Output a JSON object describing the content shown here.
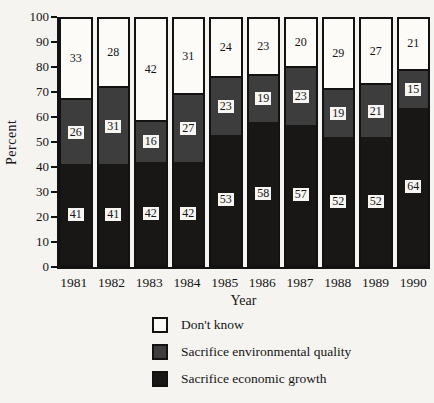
{
  "chart_data": {
    "type": "bar",
    "stacked": true,
    "title": "",
    "xlabel": "Year",
    "ylabel": "Percent",
    "ylim": [
      0,
      100
    ],
    "ytick_interval": 10,
    "grid": false,
    "categories": [
      "1981",
      "1982",
      "1983",
      "1984",
      "1985",
      "1986",
      "1987",
      "1988",
      "1989",
      "1990"
    ],
    "series": [
      {
        "name": "Sacrifice economic growth",
        "color": "#181716",
        "values": [
          41,
          41,
          42,
          42,
          53,
          58,
          57,
          52,
          52,
          64
        ]
      },
      {
        "name": "Sacrifice environmental quality",
        "color": "#3d3d3d",
        "values": [
          26,
          31,
          16,
          27,
          23,
          19,
          23,
          19,
          21,
          15
        ]
      },
      {
        "name": "Don't know",
        "color": "#fcfbf8",
        "values": [
          33,
          28,
          42,
          31,
          24,
          23,
          20,
          29,
          27,
          21
        ]
      }
    ],
    "legend_position": "bottom",
    "legend": [
      {
        "label": "Don't know",
        "color": "#fcfbf8"
      },
      {
        "label": "Sacrifice environmental quality",
        "color": "#3d3d3d"
      },
      {
        "label": "Sacrifice economic growth",
        "color": "#181716"
      }
    ],
    "colors": {
      "ink": "#121212",
      "background": "#f5f4f1",
      "label_box": "#f7f6f3"
    }
  }
}
